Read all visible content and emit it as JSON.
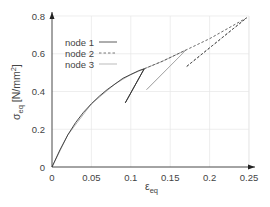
{
  "chart_data": {
    "type": "line",
    "title": "",
    "xlabel": "ε_eq",
    "ylabel": "σ_eq [N/mm²]",
    "xlim": [
      0,
      0.25
    ],
    "ylim": [
      0,
      0.8
    ],
    "xticks": [
      "0",
      "0.05",
      "0.1",
      "0.15",
      "0.2",
      "0.25"
    ],
    "yticks": [
      "0",
      "0.2",
      "0.4",
      "0.6",
      "0.8"
    ],
    "grid": true,
    "legend_position": "upper left",
    "series": [
      {
        "name": "node 1",
        "style": "solid",
        "color": "#333333",
        "x": [
          0,
          0.01,
          0.02,
          0.03,
          0.04,
          0.05,
          0.06,
          0.07,
          0.08,
          0.09,
          0.1,
          0.11,
          0.117,
          0.093,
          0.117
        ],
        "y": [
          0,
          0.09,
          0.17,
          0.235,
          0.29,
          0.335,
          0.375,
          0.41,
          0.44,
          0.47,
          0.49,
          0.51,
          0.52,
          0.34,
          0.52
        ]
      },
      {
        "name": "node 2",
        "style": "dashed",
        "color": "#555555",
        "x": [
          0.117,
          0.14,
          0.17,
          0.2,
          0.247,
          0.17,
          0.247
        ],
        "y": [
          0.52,
          0.56,
          0.62,
          0.68,
          0.79,
          0.53,
          0.79
        ]
      },
      {
        "name": "node 3",
        "style": "solid-light",
        "color": "#aaaaaa",
        "x": [
          0,
          0.02,
          0.05,
          0.08,
          0.1,
          0.117,
          0.14,
          0.17,
          0.12,
          0.17
        ],
        "y": [
          0,
          0.17,
          0.335,
          0.44,
          0.49,
          0.52,
          0.56,
          0.62,
          0.41,
          0.62
        ]
      }
    ]
  },
  "axes": {
    "xlabel_main": "ε",
    "xlabel_sub": "eq",
    "ylabel_main": "σ",
    "ylabel_sub": "eq",
    "ylabel_unit": " [N/mm",
    "ylabel_sup": "2",
    "ylabel_close": "]"
  },
  "legend": {
    "items": [
      {
        "label": "node 1"
      },
      {
        "label": "node 2"
      },
      {
        "label": "node 3"
      }
    ]
  }
}
